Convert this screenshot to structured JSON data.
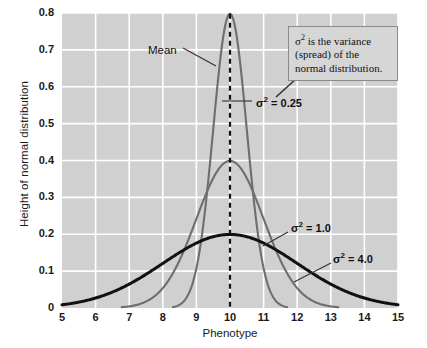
{
  "chart_data": {
    "type": "line",
    "title": "",
    "xlabel": "Phenotype",
    "ylabel": "Height of normal distribution",
    "xlim": [
      5,
      15
    ],
    "ylim": [
      0,
      0.8
    ],
    "grid": true,
    "legend_position": "inline-annotations",
    "xticks": [
      "5",
      "6",
      "7",
      "8",
      "9",
      "10",
      "11",
      "12",
      "13",
      "14",
      "15"
    ],
    "yticks": [
      "0",
      "0.1",
      "0.2",
      "0.3",
      "0.4",
      "0.5",
      "0.6",
      "0.7",
      "0.8"
    ],
    "mean": 10,
    "series": [
      {
        "name": "σ² = 0.25",
        "variance": 0.25,
        "sigma": 0.5,
        "mean": 10,
        "peak_height": 0.798,
        "color": "#6e6e6e",
        "line_width": 2.1
      },
      {
        "name": "σ² = 1.0",
        "variance": 1.0,
        "sigma": 1.0,
        "mean": 10,
        "peak_height": 0.399,
        "color": "#6e6e6e",
        "line_width": 2.1
      },
      {
        "name": "σ² = 4.0",
        "variance": 4.0,
        "sigma": 2.0,
        "mean": 10,
        "peak_height": 0.199,
        "color": "#111111",
        "line_width": 3.0
      }
    ],
    "annotations": [
      {
        "text": "Mean",
        "points_to": "peak of σ² = 0.25 curve at x = 10"
      },
      {
        "text": "σ² = 0.25",
        "points_to": "σ² = 0.25 curve"
      },
      {
        "text": "σ² = 1.0",
        "points_to": "σ² = 1.0 curve"
      },
      {
        "text": "σ² = 4.0",
        "points_to": "σ² = 4.0 curve"
      }
    ]
  },
  "labels": {
    "y_axis_title": "Height of normal distribution",
    "x_axis_title": "Phenotype",
    "mean_marker": "Mean",
    "sigma_025_sym": "σ",
    "sigma_025_exp": "2",
    "sigma_025_val": " = 0.25",
    "sigma_1_sym": "σ",
    "sigma_1_exp": "2",
    "sigma_1_val": " = 1.0",
    "sigma_4_sym": "σ",
    "sigma_4_exp": "2",
    "sigma_4_val": " = 4.0"
  },
  "callout": {
    "lead_symbol": "σ",
    "lead_exp": "2",
    "text": " is the variance (spread) of the normal distribution."
  },
  "colors": {
    "plot_background": "#d0d0d0",
    "page_background": "#ffffff",
    "gridline": "#ffffff",
    "curve_gray": "#6e6e6e",
    "curve_black": "#111111",
    "callout_fill": "#d6d6d6",
    "callout_border": "#8a8a8a",
    "text": "#1a1a1a"
  }
}
